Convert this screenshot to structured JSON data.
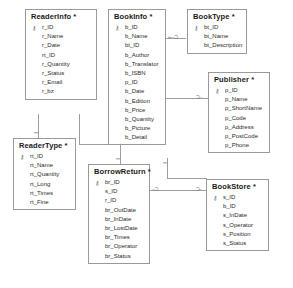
{
  "diagram": {
    "key_glyph": "⚷",
    "entities": [
      {
        "id": "readerinfo",
        "name": "ReaderInfo *",
        "fields": [
          {
            "name": "r_ID",
            "pk": true
          },
          {
            "name": "r_Name",
            "pk": false
          },
          {
            "name": "r_Date",
            "pk": false
          },
          {
            "name": "rt_ID",
            "pk": false
          },
          {
            "name": "r_Quantity",
            "pk": false
          },
          {
            "name": "r_Status",
            "pk": false
          },
          {
            "name": "r_Email",
            "pk": false
          },
          {
            "name": "r_bz",
            "pk": false
          }
        ]
      },
      {
        "id": "bookinfo",
        "name": "BookInfo *",
        "fields": [
          {
            "name": "b_ID",
            "pk": true
          },
          {
            "name": "b_Name",
            "pk": false
          },
          {
            "name": "bt_ID",
            "pk": false
          },
          {
            "name": "b_Author",
            "pk": false
          },
          {
            "name": "b_Translator",
            "pk": false
          },
          {
            "name": "b_ISBN",
            "pk": false
          },
          {
            "name": "p_ID",
            "pk": false
          },
          {
            "name": "b_Date",
            "pk": false
          },
          {
            "name": "b_Edition",
            "pk": false
          },
          {
            "name": "b_Price",
            "pk": false
          },
          {
            "name": "b_Quantity",
            "pk": false
          },
          {
            "name": "b_Picture",
            "pk": false
          },
          {
            "name": "b_Detail",
            "pk": false
          }
        ]
      },
      {
        "id": "booktype",
        "name": "BookType *",
        "fields": [
          {
            "name": "bt_ID",
            "pk": true
          },
          {
            "name": "bt_Name",
            "pk": false
          },
          {
            "name": "bt_Description",
            "pk": false
          }
        ]
      },
      {
        "id": "publisher",
        "name": "Publisher *",
        "fields": [
          {
            "name": "p_ID",
            "pk": true
          },
          {
            "name": "p_Name",
            "pk": false
          },
          {
            "name": "p_ShortName",
            "pk": false
          },
          {
            "name": "p_Code",
            "pk": false
          },
          {
            "name": "p_Address",
            "pk": false
          },
          {
            "name": "p_PostCode",
            "pk": false
          },
          {
            "name": "p_Phone",
            "pk": false
          }
        ]
      },
      {
        "id": "readertype",
        "name": "ReaderType *",
        "fields": [
          {
            "name": "rt_ID",
            "pk": true
          },
          {
            "name": "rt_Name",
            "pk": false
          },
          {
            "name": "rt_Quantity",
            "pk": false
          },
          {
            "name": "rt_Long",
            "pk": false
          },
          {
            "name": "rt_Times",
            "pk": false
          },
          {
            "name": "rt_Fine",
            "pk": false
          }
        ]
      },
      {
        "id": "borrowreturn",
        "name": "BorrowReturn *",
        "fields": [
          {
            "name": "br_ID",
            "pk": true
          },
          {
            "name": "s_ID",
            "pk": false
          },
          {
            "name": "r_ID",
            "pk": false
          },
          {
            "name": "br_OutDate",
            "pk": false
          },
          {
            "name": "br_InDate",
            "pk": false
          },
          {
            "name": "br_LostDate",
            "pk": false
          },
          {
            "name": "br_Times",
            "pk": false
          },
          {
            "name": "br_Operator",
            "pk": false
          },
          {
            "name": "br_Status",
            "pk": false
          }
        ]
      },
      {
        "id": "bookstore",
        "name": "BookStore *",
        "fields": [
          {
            "name": "s_ID",
            "pk": true
          },
          {
            "name": "b_ID",
            "pk": false
          },
          {
            "name": "s_InDate",
            "pk": false
          },
          {
            "name": "s_Operator",
            "pk": false
          },
          {
            "name": "s_Position",
            "pk": false
          },
          {
            "name": "s_Status",
            "pk": false
          }
        ]
      }
    ],
    "relationships": [
      {
        "id": "booktype-bookinfo",
        "from": "booktype",
        "to": "bookinfo",
        "one_marker": "‖",
        "many_marker": "⇐┈Ɔ"
      },
      {
        "id": "publisher-bookinfo",
        "from": "publisher",
        "to": "bookinfo",
        "one_marker": "‖",
        "many_marker": "Ɔ"
      },
      {
        "id": "readertype-readerinfo",
        "from": "readertype",
        "to": "readerinfo",
        "one_marker": "‖",
        "many_marker": "Ɔ"
      },
      {
        "id": "readerinfo-borrowreturn",
        "from": "readerinfo",
        "to": "borrowreturn",
        "one_marker": "‖",
        "many_marker": "Ɔ"
      },
      {
        "id": "bookinfo-bookstore",
        "from": "bookinfo",
        "to": "bookstore",
        "one_marker": "‖",
        "many_marker": "Ɔ"
      },
      {
        "id": "bookstore-borrowreturn",
        "from": "bookstore",
        "to": "borrowreturn",
        "one_marker": "Ɔ┈",
        "many_marker": "Ɔ┈"
      }
    ],
    "markers": {
      "crowfoot_left": "Ɔ┈",
      "crowfoot_right": "┈Ɔ",
      "double_bar": "‖"
    }
  }
}
